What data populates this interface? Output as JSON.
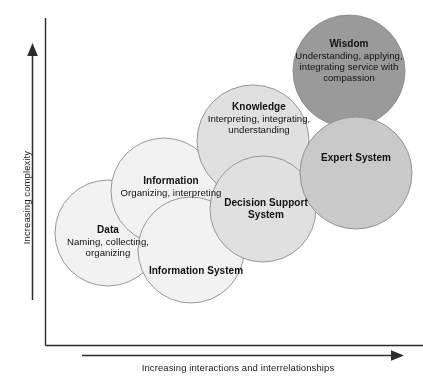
{
  "diagram": {
    "type": "venn-overlapping-circles",
    "axes": {
      "y_label": "Increasing complexity",
      "x_label": "Increasing interactions and interrelationships",
      "y_arrow": "up-arrow-icon",
      "x_arrow": "right-arrow-icon"
    },
    "palette": {
      "lightest_fill": "#f2f2f2",
      "light_fill": "#e2e2e2",
      "medium_fill": "#c9c9c9",
      "dark_fill": "#9a9a9a",
      "stroke": "#8c8c8c",
      "text": "#111111",
      "axis": "#222222"
    },
    "circles": [
      {
        "id": "data",
        "title": "Data",
        "subtitle": "Naming, collecting, organizing",
        "cx": 108,
        "cy": 233,
        "r": 53,
        "fill": "#f2f2f2",
        "label_x": 108,
        "label_y": 224,
        "label_w": 112
      },
      {
        "id": "information",
        "title": "Information",
        "subtitle": "Organizing, interpreting",
        "cx": 164,
        "cy": 191,
        "r": 53,
        "fill": "#f2f2f2",
        "label_x": 171,
        "label_y": 175,
        "label_w": 104
      },
      {
        "id": "information-system",
        "title": "Information System",
        "subtitle": "",
        "cx": 191,
        "cy": 250,
        "r": 53,
        "fill": "#f2f2f2",
        "label_x": 196,
        "label_y": 265,
        "label_w": 104
      },
      {
        "id": "knowledge",
        "title": "Knowledge",
        "subtitle": "Interpreting, integrating, understanding",
        "cx": 253,
        "cy": 141,
        "r": 56,
        "fill": "#e0e0e0",
        "label_x": 259,
        "label_y": 101,
        "label_w": 110
      },
      {
        "id": "decision-support-system",
        "title": "Decision Support System",
        "subtitle": "",
        "cx": 263,
        "cy": 209,
        "r": 53,
        "fill": "#e0e0e0",
        "label_x": 266,
        "label_y": 197,
        "label_w": 96
      },
      {
        "id": "wisdom",
        "title": "Wisdom",
        "subtitle": "Understanding, applying, integrating service with compassion",
        "cx": 349,
        "cy": 71,
        "r": 56,
        "fill": "#9a9a9a",
        "label_x": 349,
        "label_y": 38,
        "label_w": 124
      },
      {
        "id": "expert-system",
        "title": "Expert System",
        "subtitle": "",
        "cx": 356,
        "cy": 173,
        "r": 56,
        "fill": "#c9c9c9",
        "label_x": 356,
        "label_y": 152,
        "label_w": 104
      }
    ]
  }
}
